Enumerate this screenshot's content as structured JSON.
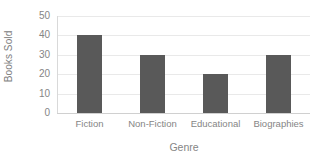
{
  "chart_data": {
    "type": "bar",
    "title": "",
    "categories": [
      "Fiction",
      "Non-Fiction",
      "Educational",
      "Biographies"
    ],
    "values": [
      40,
      30,
      20,
      30
    ],
    "xlabel": "Genre",
    "ylabel": "Books Sold",
    "ylim": [
      0,
      50
    ],
    "ytick_labels": [
      "50",
      "40",
      "30",
      "20",
      "10",
      "0"
    ],
    "ytick_values": [
      50,
      40,
      30,
      20,
      10,
      0
    ],
    "ytick_step": 10,
    "grid": "horizontal",
    "legend": "none",
    "bar_color": "#595959",
    "gridline_color": "#E9E9E9",
    "text_color": "#858585",
    "background_color": "#FFFFFF"
  },
  "axes": {
    "y_title": "Books Sold",
    "x_title": "Genre"
  }
}
